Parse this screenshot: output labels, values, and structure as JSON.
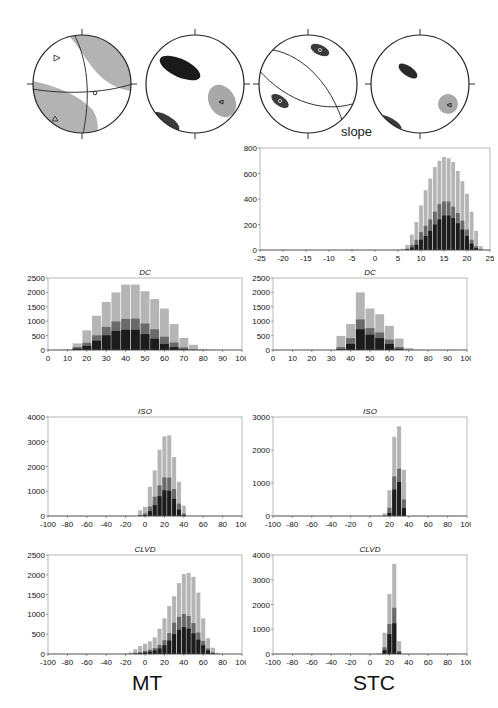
{
  "stereonets": [
    {
      "id": "beachball",
      "x": 5,
      "y": 20,
      "r": 50
    },
    {
      "id": "density-1",
      "x": 118,
      "y": 20,
      "r": 50
    },
    {
      "id": "density-2",
      "x": 233,
      "y": 20,
      "r": 50
    },
    {
      "id": "density-3",
      "x": 351,
      "y": 20,
      "r": 50
    }
  ],
  "labels": {
    "slope": "slope",
    "mt": "MT",
    "stc": "STC"
  },
  "colors": {
    "light": "#b5b5b5",
    "mid": "#6a6a6a",
    "dark": "#1c1c1c",
    "axis": "#999999",
    "text": "#111111"
  },
  "chart_data": [
    {
      "id": "slope",
      "type": "bar",
      "title": "",
      "xlabel": "slope",
      "panel": "STC",
      "xlim": [
        -25,
        25
      ],
      "ylim": [
        0,
        800
      ],
      "xticks": [
        -25,
        -20,
        -15,
        -10,
        -5,
        0,
        5,
        10,
        15,
        20,
        25
      ],
      "yticks": [
        0,
        200,
        400,
        600,
        800
      ],
      "binwidth": 1,
      "x": [
        6,
        7,
        8,
        9,
        10,
        11,
        12,
        13,
        14,
        15,
        16,
        17,
        18,
        19,
        20,
        21,
        22,
        23
      ],
      "series": [
        {
          "name": "light",
          "values": [
            10,
            40,
            120,
            220,
            350,
            470,
            560,
            650,
            700,
            730,
            720,
            690,
            620,
            540,
            440,
            300,
            150,
            30
          ]
        },
        {
          "name": "mid",
          "values": [
            0,
            10,
            40,
            80,
            140,
            190,
            240,
            300,
            360,
            380,
            380,
            340,
            290,
            230,
            160,
            80,
            30,
            5
          ]
        },
        {
          "name": "dark",
          "values": [
            0,
            5,
            20,
            40,
            80,
            110,
            150,
            200,
            240,
            270,
            270,
            250,
            210,
            160,
            110,
            50,
            15,
            2
          ]
        }
      ]
    },
    {
      "id": "mt-dc",
      "type": "bar",
      "title": "DC",
      "panel": "MT",
      "xlim": [
        0,
        100
      ],
      "ylim": [
        0,
        2500
      ],
      "xticks": [
        0,
        10,
        20,
        30,
        40,
        50,
        60,
        70,
        80,
        90,
        100
      ],
      "yticks": [
        0,
        500,
        1000,
        1500,
        2000,
        2500
      ],
      "binwidth": 5,
      "x": [
        10,
        15,
        20,
        25,
        30,
        35,
        40,
        45,
        50,
        55,
        60,
        65,
        70,
        75,
        80,
        85
      ],
      "series": [
        {
          "name": "light",
          "values": [
            20,
            230,
            680,
            1190,
            1670,
            2000,
            2270,
            2270,
            2040,
            1770,
            1440,
            900,
            420,
            180,
            40,
            10
          ]
        },
        {
          "name": "mid",
          "values": [
            5,
            100,
            250,
            510,
            800,
            990,
            1080,
            1090,
            920,
            720,
            460,
            260,
            90,
            20,
            5,
            0
          ]
        },
        {
          "name": "dark",
          "values": [
            0,
            50,
            140,
            320,
            510,
            660,
            700,
            700,
            550,
            390,
            210,
            100,
            30,
            5,
            0,
            0
          ]
        }
      ]
    },
    {
      "id": "stc-dc",
      "type": "bar",
      "title": "DC",
      "panel": "STC",
      "xlim": [
        0,
        100
      ],
      "ylim": [
        0,
        2500
      ],
      "xticks": [
        0,
        10,
        20,
        30,
        40,
        50,
        60,
        70,
        80,
        90,
        100
      ],
      "yticks": [
        0,
        500,
        1000,
        1500,
        2000,
        2500
      ],
      "binwidth": 5,
      "x": [
        35,
        40,
        45,
        50,
        55,
        60,
        65,
        70,
        75
      ],
      "series": [
        {
          "name": "light",
          "values": [
            490,
            900,
            2000,
            1440,
            1240,
            840,
            400,
            70,
            10
          ]
        },
        {
          "name": "mid",
          "values": [
            100,
            410,
            1060,
            760,
            610,
            360,
            100,
            10,
            0
          ]
        },
        {
          "name": "dark",
          "values": [
            30,
            210,
            720,
            530,
            410,
            210,
            40,
            0,
            0
          ]
        }
      ]
    },
    {
      "id": "mt-iso",
      "type": "bar",
      "title": "ISO",
      "panel": "MT",
      "xlim": [
        -100,
        100
      ],
      "ylim": [
        0,
        4000
      ],
      "xticks": [
        -100,
        -80,
        -60,
        -40,
        -20,
        0,
        20,
        40,
        60,
        80,
        100
      ],
      "yticks": [
        0,
        1000,
        2000,
        3000,
        4000
      ],
      "binwidth": 5,
      "x": [
        -5,
        0,
        5,
        10,
        15,
        20,
        25,
        30,
        35,
        40
      ],
      "series": [
        {
          "name": "light",
          "values": [
            230,
            370,
            1180,
            1840,
            2680,
            3220,
            3260,
            2380,
            1380,
            420
          ]
        },
        {
          "name": "mid",
          "values": [
            40,
            100,
            380,
            780,
            1240,
            1560,
            1550,
            1090,
            500,
            100
          ]
        },
        {
          "name": "dark",
          "values": [
            10,
            40,
            200,
            440,
            800,
            1040,
            1020,
            690,
            260,
            40
          ]
        }
      ]
    },
    {
      "id": "stc-iso",
      "type": "bar",
      "title": "ISO",
      "panel": "STC",
      "xlim": [
        -100,
        100
      ],
      "ylim": [
        0,
        3000
      ],
      "xticks": [
        -100,
        -80,
        -60,
        -40,
        -20,
        0,
        20,
        40,
        60,
        80,
        100
      ],
      "yticks": [
        0,
        1000,
        2000,
        3000
      ],
      "binwidth": 5,
      "x": [
        15,
        20,
        25,
        30,
        35
      ],
      "series": [
        {
          "name": "light",
          "values": [
            80,
            780,
            2400,
            2720,
            1400
          ]
        },
        {
          "name": "mid",
          "values": [
            20,
            250,
            1200,
            1430,
            500
          ]
        },
        {
          "name": "dark",
          "values": [
            5,
            90,
            800,
            1030,
            240
          ]
        }
      ]
    },
    {
      "id": "mt-clvd",
      "type": "bar",
      "title": "CLVD",
      "panel": "MT",
      "xlim": [
        -100,
        100
      ],
      "ylim": [
        0,
        2500
      ],
      "xticks": [
        -100,
        -80,
        -60,
        -40,
        -20,
        0,
        20,
        40,
        60,
        80,
        100
      ],
      "yticks": [
        0,
        500,
        1000,
        1500,
        2000,
        2500
      ],
      "binwidth": 5,
      "x": [
        -20,
        -15,
        -10,
        -5,
        0,
        5,
        10,
        15,
        20,
        25,
        30,
        35,
        40,
        45,
        50,
        55,
        60,
        65,
        70,
        75
      ],
      "series": [
        {
          "name": "light",
          "values": [
            10,
            40,
            120,
            200,
            260,
            320,
            420,
            640,
            900,
            1210,
            1460,
            1790,
            2020,
            2050,
            1950,
            1550,
            900,
            400,
            160,
            30
          ]
        },
        {
          "name": "mid",
          "values": [
            0,
            10,
            30,
            50,
            80,
            110,
            150,
            230,
            350,
            530,
            790,
            940,
            1010,
            960,
            780,
            540,
            330,
            140,
            40,
            5
          ]
        },
        {
          "name": "dark",
          "values": [
            0,
            0,
            10,
            20,
            40,
            60,
            90,
            140,
            220,
            340,
            500,
            610,
            680,
            640,
            520,
            360,
            220,
            90,
            20,
            0
          ]
        }
      ]
    },
    {
      "id": "stc-clvd",
      "type": "bar",
      "title": "CLVD",
      "panel": "STC",
      "xlim": [
        -100,
        100
      ],
      "ylim": [
        0,
        4000
      ],
      "xticks": [
        -100,
        -80,
        -60,
        -40,
        -20,
        0,
        20,
        40,
        60,
        80,
        100
      ],
      "yticks": [
        0,
        1000,
        2000,
        3000,
        4000
      ],
      "binwidth": 5,
      "x": [
        10,
        15,
        20,
        25,
        30
      ],
      "series": [
        {
          "name": "light",
          "values": [
            30,
            860,
            2430,
            3640,
            520
          ]
        },
        {
          "name": "mid",
          "values": [
            5,
            270,
            1210,
            1870,
            120
          ]
        },
        {
          "name": "dark",
          "values": [
            0,
            150,
            800,
            1240,
            60
          ]
        }
      ]
    }
  ],
  "layout": {
    "slope": {
      "x": 260,
      "y": 148,
      "w": 230,
      "h": 102
    },
    "mt-dc": {
      "x": 48,
      "y": 278,
      "w": 194,
      "h": 72
    },
    "stc-dc": {
      "x": 273,
      "y": 278,
      "w": 194,
      "h": 72
    },
    "mt-iso": {
      "x": 48,
      "y": 417,
      "w": 194,
      "h": 99
    },
    "stc-iso": {
      "x": 273,
      "y": 417,
      "w": 194,
      "h": 99
    },
    "mt-clvd": {
      "x": 48,
      "y": 555,
      "w": 194,
      "h": 99
    },
    "stc-clvd": {
      "x": 273,
      "y": 555,
      "w": 194,
      "h": 99
    }
  }
}
